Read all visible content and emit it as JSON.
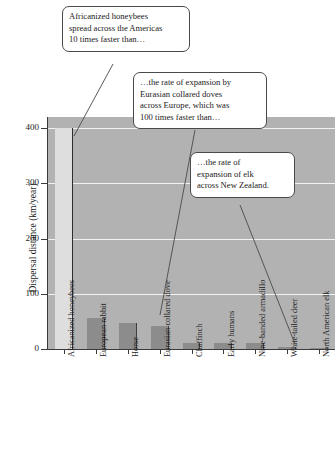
{
  "chart_data": {
    "type": "bar",
    "title": "",
    "xlabel": "",
    "ylabel": "Dispersal distance (km/year)",
    "ylim": [
      0,
      420
    ],
    "yticks": [
      0,
      100,
      200,
      300,
      400
    ],
    "ytick_labels": [
      "0",
      "100",
      "200",
      "300",
      "400"
    ],
    "grid": "horizontal gridlines, white, on gray panel",
    "legend": "none",
    "categories": [
      "Africanized honeybees",
      "European rabbit",
      "Horse",
      "Eurasian collared dove",
      "Chaffinch",
      "Early humans",
      "Nine-banded armadillo",
      "White-tailed deer",
      "North American elk"
    ],
    "values": [
      400,
      57,
      47,
      42,
      11,
      10,
      10,
      3,
      1
    ],
    "bar_colors": [
      "#dedede",
      "#8c8c8c",
      "#8c8c8c",
      "#8c8c8c",
      "#8c8c8c",
      "#8c8c8c",
      "#8c8c8c",
      "#8c8c8c",
      "#8c8c8c"
    ],
    "panel_color": "#b2b2b2",
    "gridline_color": "#f2f2f2",
    "axis_color": "#3a3a3a",
    "annotations": [
      {
        "id": "honeybees",
        "text": "Africanized honeybees spread across the Americas 10 times faster than…",
        "lines": [
          "Africanized honeybees",
          "spread across the Americas",
          "10 times faster than…"
        ],
        "points_to": "Africanized honeybees"
      },
      {
        "id": "doves",
        "text": "…the rate of expansion by Eurasian collared doves across Europe, which was 100 times faster than…",
        "lines": [
          "…the rate of expansion by",
          "Eurasian collared doves",
          "across Europe, which was",
          "100 times faster than…"
        ],
        "points_to": "Eurasian collared dove"
      },
      {
        "id": "elk",
        "text": "…the rate of expansion of elk across New Zealand.",
        "lines": [
          "…the rate of",
          "expansion of elk",
          "across New Zealand."
        ],
        "points_to": "North American elk"
      }
    ]
  }
}
